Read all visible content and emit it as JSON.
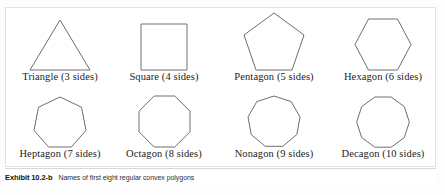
{
  "figure": {
    "caption_exhibit": "Exhibit 10.2-b",
    "caption_text": "Names of first eight regular convex polygons"
  },
  "polygons": [
    {
      "name": "Triangle",
      "sides": 3,
      "label": "Triangle (3 sides)",
      "shape": "triangle",
      "row": 0,
      "col": 0
    },
    {
      "name": "Square",
      "sides": 4,
      "label": "Square (4 sides)",
      "shape": "square",
      "row": 0,
      "col": 1
    },
    {
      "name": "Pentagon",
      "sides": 5,
      "label": "Pentagon (5 sides)",
      "shape": "pentagon",
      "row": 0,
      "col": 2
    },
    {
      "name": "Hexagon",
      "sides": 6,
      "label": "Hexagon (6 sides)",
      "shape": "hexagon",
      "row": 0,
      "col": 3
    },
    {
      "name": "Heptagon",
      "sides": 7,
      "label": "Heptagon (7 sides)",
      "shape": "heptagon",
      "row": 1,
      "col": 0
    },
    {
      "name": "Octagon",
      "sides": 8,
      "label": "Octagon (8 sides)",
      "shape": "octagon",
      "row": 1,
      "col": 1
    },
    {
      "name": "Nonagon",
      "sides": 9,
      "label": "Nonagon (9 sides)",
      "shape": "nonagon",
      "row": 1,
      "col": 2
    },
    {
      "name": "Decagon",
      "sides": 10,
      "label": "Decagon (10 sides)",
      "shape": "decagon",
      "row": 1,
      "col": 3
    }
  ],
  "colors": {
    "shape_stroke": "#6e6e6e",
    "panel_border": "#e3e3e3",
    "label_text": "#1c1c1c",
    "caption_text": "#2e2e2e",
    "background": "#ffffff"
  }
}
